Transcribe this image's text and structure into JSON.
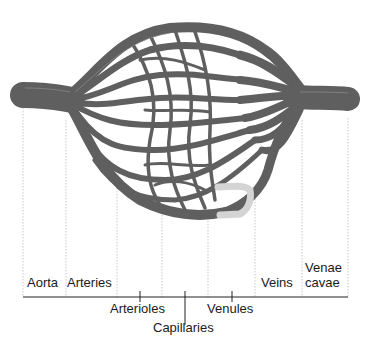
{
  "diagram": {
    "type": "blood-vessel-network",
    "colors": {
      "vessel": "#5f5f5f",
      "vessel_highlight": "#8a8a8a",
      "vessel_highlight_segment": "#d4d4d4",
      "guide_lines": "#b5b5b5",
      "axis": "#222222",
      "text": "#1a1a1a",
      "background": "#ffffff"
    },
    "labels_above_axis": [
      {
        "id": "aorta",
        "text": "Aorta"
      },
      {
        "id": "arteries",
        "text": "Arteries"
      },
      {
        "id": "veins",
        "text": "Veins"
      },
      {
        "id": "venae-cavae-line1",
        "text": "Venae"
      },
      {
        "id": "venae-cavae-line2",
        "text": "cavae"
      }
    ],
    "labels_below_axis": [
      {
        "id": "arterioles",
        "text": "Arterioles"
      },
      {
        "id": "capillaries",
        "text": "Capillaries"
      },
      {
        "id": "venules",
        "text": "Venules"
      }
    ],
    "guide_line_x": [
      23,
      66,
      117,
      162,
      208,
      255,
      302,
      348
    ],
    "tick_x": [
      140,
      185,
      232
    ]
  }
}
